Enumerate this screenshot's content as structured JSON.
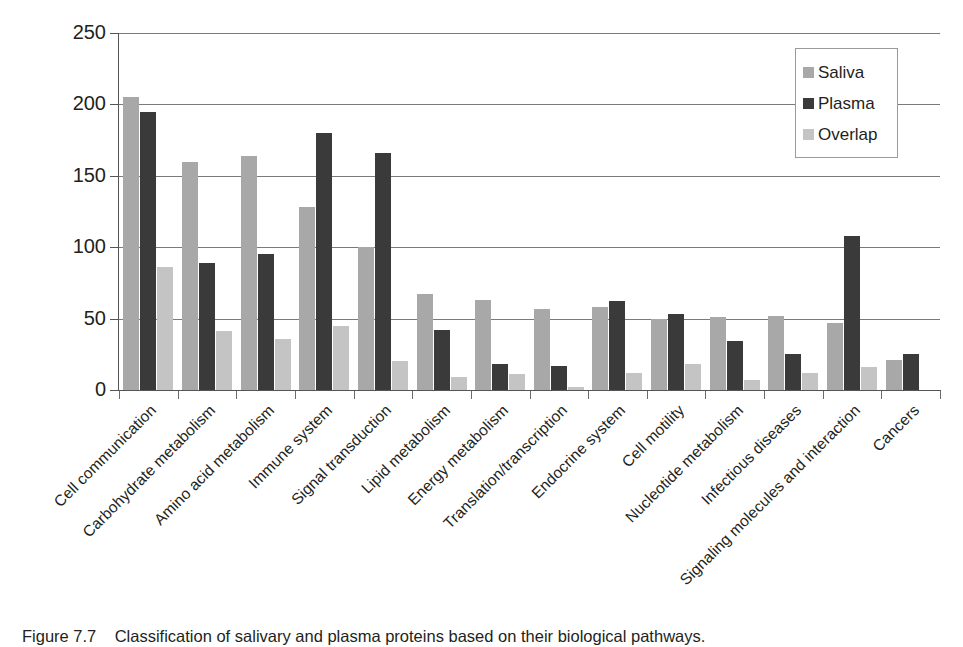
{
  "figure": {
    "caption_label": "Figure  7.7",
    "caption_text": "Classification of salivary and plasma proteins based on their biological pathways."
  },
  "legend": {
    "position": "top-right",
    "entries": [
      {
        "label": "Saliva",
        "color": "#a8a8a8"
      },
      {
        "label": "Plasma",
        "color": "#3a3a3a"
      },
      {
        "label": "Overlap",
        "color": "#c4c4c4"
      }
    ]
  },
  "axis": {
    "y_ticks": [
      "0",
      "50",
      "100",
      "150",
      "200",
      "250"
    ]
  },
  "chart_data": {
    "type": "bar",
    "title": "",
    "subtitle": "",
    "xlabel": "",
    "ylabel": "",
    "ylim": [
      0,
      250
    ],
    "ytick_values": [
      0,
      50,
      100,
      150,
      200,
      250
    ],
    "grid": "horizontal",
    "legend_position": "top-right",
    "categories": [
      "Cell communication",
      "Carbohydrate metabolism",
      "Amino acid metabolism",
      "Immune system",
      "Signal transduction",
      "Lipid metabolism",
      "Energy metabolism",
      "Translation/transcription",
      "Endocrine system",
      "Cell motility",
      "Nucleotide metabolism",
      "Infectious diseases",
      "Signaling molecules and interaction",
      "Cancers"
    ],
    "series": [
      {
        "name": "Saliva",
        "color": "#a8a8a8",
        "values": [
          205,
          160,
          164,
          128,
          100,
          67,
          63,
          57,
          58,
          50,
          51,
          52,
          47,
          21
        ]
      },
      {
        "name": "Plasma",
        "color": "#3a3a3a",
        "values": [
          195,
          89,
          95,
          180,
          166,
          42,
          18,
          17,
          62,
          53,
          34,
          25,
          108,
          25
        ]
      },
      {
        "name": "Overlap",
        "color": "#c4c4c4",
        "values": [
          86,
          41,
          36,
          45,
          20,
          9,
          11,
          2,
          12,
          18,
          7,
          12,
          16,
          0
        ]
      }
    ]
  }
}
